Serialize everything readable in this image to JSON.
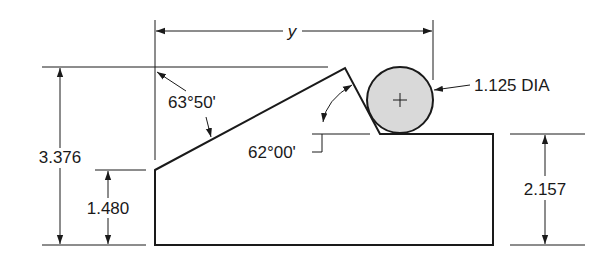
{
  "figure": {
    "type": "engineering-drawing"
  },
  "dimensions": {
    "overall_length_label": "y",
    "total_height": "3.376",
    "left_height": "1.480",
    "right_height": "2.157",
    "pin_diameter": "1.125 DIA",
    "slope_angle": "63°50'",
    "notch_angle": "62°00'"
  },
  "colors": {
    "line": "#1a1a1a",
    "pin_fill": "#d9d9d9",
    "background": "#ffffff"
  }
}
